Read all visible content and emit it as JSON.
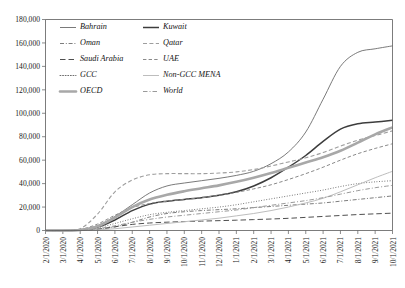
{
  "chart_data": {
    "type": "line",
    "title": "",
    "xlabel": "",
    "ylabel": "",
    "ylim": [
      0,
      180000
    ],
    "ytick_step": 20000,
    "grid": false,
    "legend_position": "top-left-inside",
    "legend_columns": 2,
    "x": [
      "2/1/2020",
      "3/1/2020",
      "4/1/2020",
      "5/1/2020",
      "6/1/2020",
      "7/1/2020",
      "8/1/2020",
      "9/1/2020",
      "10/1/2020",
      "11/1/2020",
      "12/1/2020",
      "1/1/2021",
      "2/1/2021",
      "3/1/2021",
      "4/1/2021",
      "5/1/2021",
      "6/1/2021",
      "7/1/2021",
      "8/1/2021",
      "9/1/2021",
      "10/1/2021"
    ],
    "ytick_labels": [
      "0",
      "20,000",
      "40,000",
      "60,000",
      "80,000",
      "100,000",
      "120,000",
      "140,000",
      "160,000",
      "180,000"
    ],
    "series": [
      {
        "name": "Bahrain",
        "style": "solid-thin",
        "color": "#6b6b6b",
        "width": 0.9,
        "values": [
          0,
          0,
          600,
          4200,
          12000,
          22000,
          32000,
          38000,
          40500,
          42500,
          44500,
          47000,
          50500,
          57000,
          67000,
          84000,
          112000,
          140000,
          152000,
          155000,
          157500
        ]
      },
      {
        "name": "Kuwait",
        "style": "solid-medium",
        "color": "#3d3d3d",
        "width": 1.5,
        "values": [
          0,
          0,
          500,
          3000,
          9000,
          17000,
          22500,
          25000,
          26500,
          28000,
          30000,
          33000,
          38000,
          45000,
          54000,
          64000,
          76000,
          86500,
          91000,
          92500,
          94000
        ]
      },
      {
        "name": "Oman",
        "style": "dash-dot",
        "color": "#6e6e6e",
        "width": 0.9,
        "values": [
          0,
          0,
          150,
          900,
          3000,
          7000,
          11500,
          14500,
          16000,
          17000,
          17800,
          18500,
          19500,
          20500,
          21500,
          22500,
          23500,
          25000,
          26500,
          28000,
          29500
        ]
      },
      {
        "name": "Qatar",
        "style": "dashed-light",
        "color": "#9e9e9e",
        "width": 1.1,
        "values": [
          0,
          0,
          1500,
          14000,
          33000,
          43000,
          47500,
          48500,
          48500,
          48500,
          49000,
          50000,
          52000,
          55000,
          58500,
          62000,
          66500,
          72000,
          77000,
          81000,
          85000
        ]
      },
      {
        "name": "Saudi Arabia",
        "style": "dashed-long",
        "color": "#4f4f4f",
        "width": 1.0,
        "values": [
          0,
          0,
          200,
          1200,
          3200,
          5200,
          6400,
          7100,
          7600,
          8000,
          8400,
          8800,
          9300,
          9800,
          10400,
          11200,
          12000,
          12800,
          13600,
          14200,
          14800
        ]
      },
      {
        "name": "UAE",
        "style": "dashed-med",
        "color": "#8a8a8a",
        "width": 1.0,
        "values": [
          0,
          0,
          900,
          5500,
          13000,
          19500,
          23000,
          25000,
          26500,
          28000,
          30000,
          32500,
          35500,
          39000,
          43500,
          48500,
          54000,
          60000,
          65500,
          70000,
          74000
        ]
      },
      {
        "name": "GCC",
        "style": "dotted",
        "color": "#5d5d5d",
        "width": 0.9,
        "values": [
          0,
          0,
          350,
          2200,
          6000,
          10000,
          13500,
          15500,
          17000,
          18500,
          20000,
          22000,
          24500,
          27000,
          29500,
          32000,
          34500,
          37500,
          40000,
          41500,
          42500
        ]
      },
      {
        "name": "Non-GCC MENA",
        "style": "solid-light",
        "color": "#bdbdbd",
        "width": 1.0,
        "values": [
          0,
          0,
          100,
          500,
          1500,
          3000,
          4500,
          6000,
          7500,
          9000,
          10500,
          12500,
          14500,
          17000,
          20000,
          23500,
          27500,
          33000,
          39000,
          45000,
          50500
        ]
      },
      {
        "name": "OECD",
        "style": "solid-thick",
        "color": "#a8a8a8",
        "width": 2.6,
        "values": [
          0,
          0,
          400,
          3500,
          11000,
          20000,
          26500,
          30500,
          33500,
          36000,
          38500,
          41500,
          45000,
          49000,
          53500,
          58000,
          62500,
          68000,
          75000,
          82000,
          88000
        ]
      },
      {
        "name": "World",
        "style": "dash-dot-light",
        "color": "#9a9a9a",
        "width": 1.0,
        "values": [
          0,
          0,
          250,
          1500,
          4000,
          7000,
          9500,
          11500,
          13000,
          14500,
          16000,
          17500,
          19500,
          21500,
          23500,
          25500,
          28000,
          31000,
          34000,
          36500,
          38500
        ]
      }
    ],
    "legend": [
      {
        "name": "Bahrain",
        "col": 0
      },
      {
        "name": "Kuwait",
        "col": 1
      },
      {
        "name": "Oman",
        "col": 0
      },
      {
        "name": "Qatar",
        "col": 1
      },
      {
        "name": "Saudi Arabia",
        "col": 0
      },
      {
        "name": "UAE",
        "col": 1
      },
      {
        "name": "GCC",
        "col": 0
      },
      {
        "name": "Non-GCC MENA",
        "col": 1
      },
      {
        "name": "OECD",
        "col": 0
      },
      {
        "name": "World",
        "col": 1
      }
    ]
  }
}
